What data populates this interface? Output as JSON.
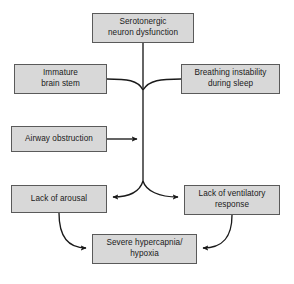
{
  "figure": {
    "type": "flow-diagram",
    "title_fragment": "",
    "background_color": "#ffffff",
    "node_fill_color": "#d8d8d8",
    "node_border_color": "#5a5a5a",
    "edge_color": "#1a1a1a",
    "text_color": "#1a1a1a"
  },
  "nodes": [
    {
      "id": "serotonergic",
      "label": "Serotonergic\nneuron dysfunction",
      "x": 92,
      "y": 13,
      "w": 102,
      "h": 30
    },
    {
      "id": "immature",
      "label": "Immature\nbrain stem",
      "x": 14,
      "y": 64,
      "w": 93,
      "h": 30
    },
    {
      "id": "breathing",
      "label": "Breathing instability\nduring sleep",
      "x": 181,
      "y": 64,
      "w": 99,
      "h": 30
    },
    {
      "id": "airway",
      "label": "Airway obstruction",
      "x": 11,
      "y": 126,
      "w": 96,
      "h": 26
    },
    {
      "id": "arousal",
      "label": "Lack of arousal",
      "x": 11,
      "y": 185,
      "w": 96,
      "h": 28
    },
    {
      "id": "ventilatory",
      "label": "Lack of ventilatory\nresponse",
      "x": 184,
      "y": 185,
      "w": 96,
      "h": 30
    },
    {
      "id": "hypercapnia",
      "label": "Severe hypercapnia/\nhypoxia",
      "x": 92,
      "y": 234,
      "w": 105,
      "h": 30
    }
  ],
  "edges": [
    {
      "id": "serotonergic-to-trunk",
      "from": "serotonergic",
      "to": "trunk",
      "arrow": false
    },
    {
      "id": "immature-to-trunk",
      "from": "immature",
      "to": "trunk",
      "arrow": false
    },
    {
      "id": "breathing-to-trunk",
      "from": "breathing",
      "to": "trunk",
      "arrow": false
    },
    {
      "id": "airway-to-trunk",
      "from": "airway",
      "to": "trunk",
      "arrow": true
    },
    {
      "id": "trunk-to-arousal",
      "from": "trunk",
      "to": "arousal",
      "arrow": true
    },
    {
      "id": "trunk-to-ventilatory",
      "from": "trunk",
      "to": "ventilatory",
      "arrow": true
    },
    {
      "id": "arousal-to-hypercapnia",
      "from": "arousal",
      "to": "hypercapnia",
      "arrow": true
    },
    {
      "id": "ventilatory-to-hypercapnia",
      "from": "ventilatory",
      "to": "hypercapnia",
      "arrow": true
    }
  ]
}
